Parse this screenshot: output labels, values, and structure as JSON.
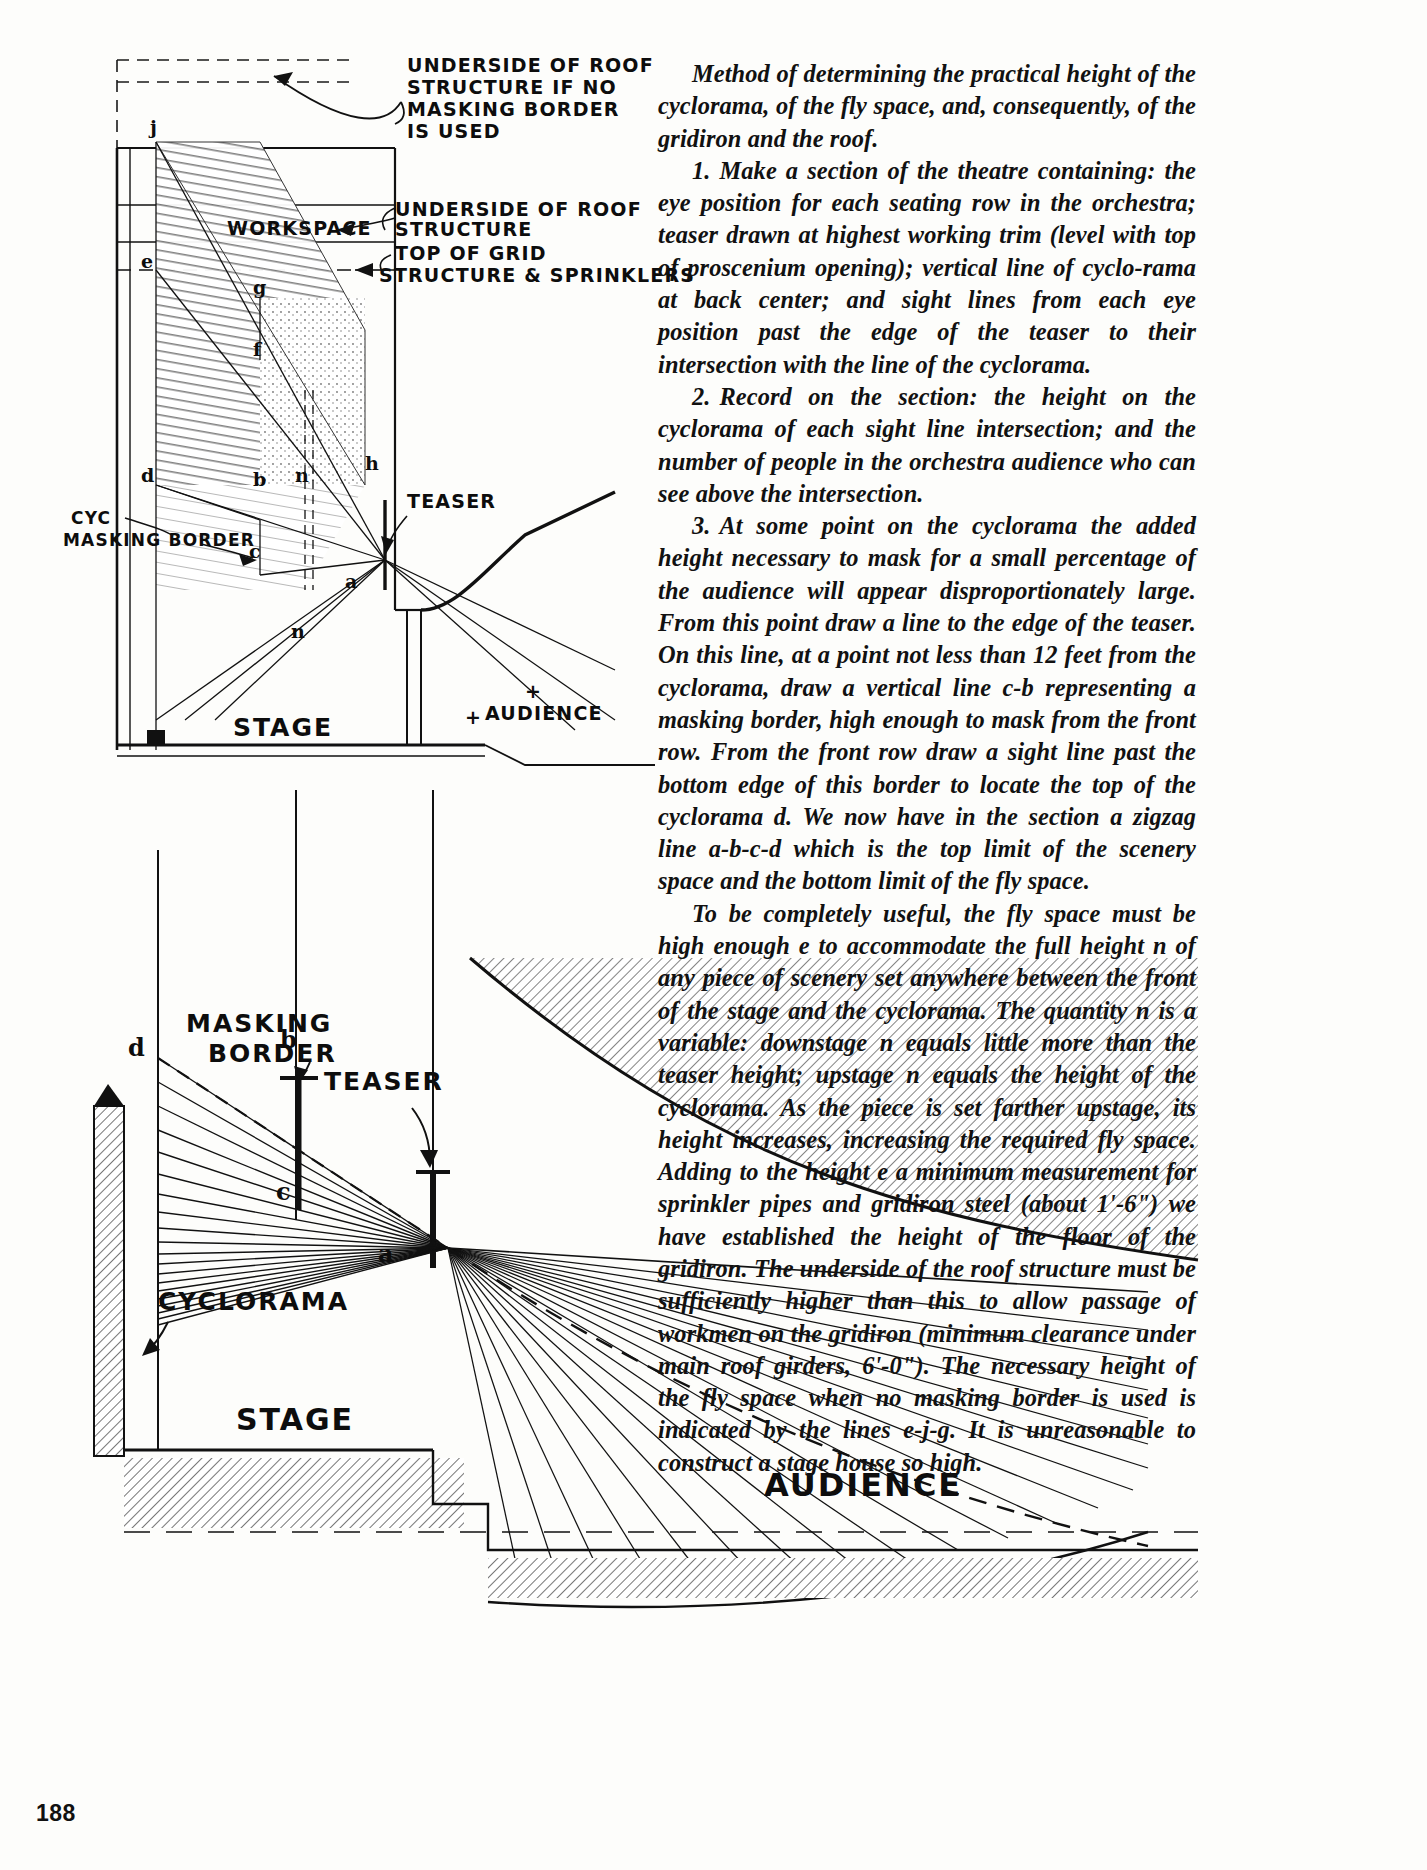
{
  "page": {
    "folio": "188"
  },
  "body_text": {
    "paragraphs": [
      {
        "id": "intro",
        "number": "",
        "text": "Method of determining the practical height of the cyclorama, of the fly space, and, consequently, of the gridiron and the roof."
      },
      {
        "id": "step-1",
        "number": "1.",
        "text": "Make a section of the theatre containing: the eye position for each seating row in the orchestra; teaser drawn at highest working trim (level with top of proscenium opening); vertical line of cyclo-rama at back center; and sight lines from each eye position past the edge of the teaser to their intersection with the line of the cyclorama."
      },
      {
        "id": "step-2",
        "number": "2.",
        "text": "Record on the section: the height on the cyclorama of each sight line intersection; and the number of people in the orchestra audience who can see above the intersection."
      },
      {
        "id": "step-3",
        "number": "3.",
        "text": "At some point on the cyclorama the added height necessary to mask for a small percentage of the audience will appear disproportionately large. From this point draw a line to the edge of the teaser. On this line, at a point not less than 12 feet from the cyclorama, draw a vertical line c-b representing a masking border, high enough to mask from the front row. From the front row draw a sight line past the bottom edge of this border to locate the top of the cyclorama d. We now have in the section a zigzag line a-b-c-d which is the top limit of the scenery space and the bottom limit of the fly space."
      },
      {
        "id": "closing",
        "number": "",
        "text": "To be completely useful, the fly space must be high enough e to accommodate the full height n of any piece of scenery set anywhere between the front of the stage and the cyclorama. The quantity n is a variable: downstage n equals little more than the teaser height; upstage n equals the height of the cyclorama. As the piece is set farther upstage, its height increases, increasing the required fly space. Adding to the height e a minimum measurement for sprinkler pipes and gridiron steel (about 1'-6\") we have established the height of the floor of the gridiron. The underside of the roof structure must be sufficiently higher than this to allow passage of workmen on the gridiron (minimum clearance under main roof girders, 6'-0\"). The necessary height of the fly space when no masking border is used is indicated by the lines e-j-g. It is unreasonable to construct a stage house so high."
      }
    ]
  },
  "figure_upper": {
    "title": "section-diagram-fly-space",
    "annotations": [
      {
        "id": "underside-no-border",
        "lines": [
          "UNDERSIDE OF ROOF",
          "STRUCTURE IF NO",
          "MASKING BORDER",
          "IS USED"
        ]
      },
      {
        "id": "workspace",
        "lines": [
          "WORKSPACE"
        ]
      },
      {
        "id": "underside-roof",
        "lines": [
          "UNDERSIDE OF ROOF",
          "STRUCTURE"
        ]
      },
      {
        "id": "top-of-grid",
        "lines": [
          "TOP OF GRID"
        ]
      },
      {
        "id": "structure-sprinklers",
        "lines": [
          "STRUCTURE & SPRINKLERS"
        ]
      },
      {
        "id": "teaser",
        "lines": [
          "TEASER"
        ]
      },
      {
        "id": "cyc-masking-border",
        "lines": [
          "CYC",
          "MASKING BORDER"
        ]
      },
      {
        "id": "stage",
        "lines": [
          "STAGE"
        ]
      },
      {
        "id": "audience",
        "lines": [
          "AUDIENCE"
        ]
      }
    ],
    "point_labels": [
      "j",
      "e",
      "g",
      "f",
      "h",
      "d",
      "b",
      "c",
      "a",
      "n"
    ]
  },
  "figure_lower": {
    "title": "sightline-fan-diagram",
    "annotations": [
      {
        "id": "masking-border",
        "lines": [
          "MASKING",
          "BORDER"
        ]
      },
      {
        "id": "teaser",
        "lines": [
          "TEASER"
        ]
      },
      {
        "id": "cyclorama",
        "lines": [
          "CYCLORAMA"
        ]
      },
      {
        "id": "stage",
        "lines": [
          "STAGE"
        ]
      },
      {
        "id": "audience",
        "lines": [
          "AUDIENCE"
        ]
      }
    ],
    "point_labels": [
      "d",
      "b",
      "c",
      "a"
    ]
  },
  "colors": {
    "ink": "#0d0d0d",
    "paper": "#fdfdfb",
    "hatch_dark": "#8c8c8c",
    "hatch_light": "#cfcfcf",
    "stipple": "#e8e6e0"
  }
}
